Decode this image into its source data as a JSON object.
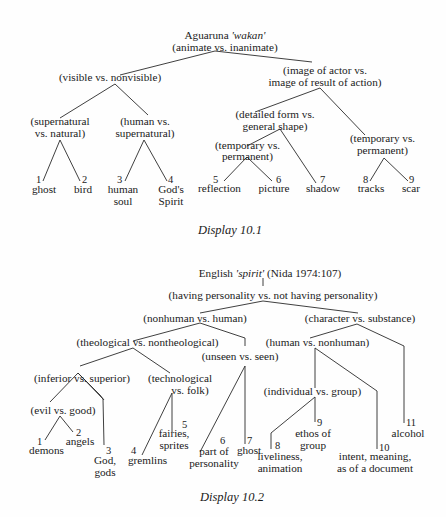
{
  "display1": {
    "caption": "Display 10.1",
    "root": {
      "word_prefix": "Aguaruna ",
      "word": "'wakan'",
      "contrast": "(animate vs. inanimate)"
    },
    "nodes": {
      "visible": "(visible vs. nonvisible)",
      "image_l1": "(image of actor vs.",
      "image_l2": "image of result of action)",
      "super_l1": "(supernatural",
      "super_l2": "vs. natural)",
      "human_l1": "(human vs.",
      "human_l2": "supernatural)",
      "detailed_l1": "(detailed form vs.",
      "detailed_l2": "general shape)",
      "temp1_l1": "(temporary vs.",
      "temp1_l2": "permanent)",
      "temp2_l1": "(temporary vs.",
      "temp2_l2": "permanent)"
    },
    "leaves": [
      {
        "num": "1",
        "label": "ghost"
      },
      {
        "num": "2",
        "label": "bird"
      },
      {
        "num": "3",
        "label": "human",
        "label2": "soul"
      },
      {
        "num": "4",
        "label": "God's",
        "label2": "Spirit"
      },
      {
        "num": "5",
        "label": "reflection"
      },
      {
        "num": "6",
        "label": "picture"
      },
      {
        "num": "7",
        "label": "shadow"
      },
      {
        "num": "8",
        "label": "tracks"
      },
      {
        "num": "9",
        "label": "scar"
      }
    ]
  },
  "display2": {
    "caption": "Display 10.2",
    "root": {
      "word_prefix": "English ",
      "word": "'spirit'",
      "source": " (Nida 1974:107)"
    },
    "nodes": {
      "having": "(having personality vs. not having personality)",
      "nonhuman": "(nonhuman vs. human)",
      "character": "(character vs. substance)",
      "theological": "(theological vs. nontheological)",
      "human_nonhuman": "(human vs. nonhuman)",
      "unseen": "(unseen vs. seen)",
      "inferior": "(inferior vs. superior)",
      "tech_l1": "(technological",
      "tech_l2": "vs. folk)",
      "individual": "(individual vs. group)",
      "evil": "(evil vs. good)"
    },
    "leaves": [
      {
        "num": "1",
        "label": "demons"
      },
      {
        "num": "2",
        "label": "angels"
      },
      {
        "num": "3",
        "label": "God,",
        "label2": "gods"
      },
      {
        "num": "4",
        "label": "gremlins"
      },
      {
        "num": "5",
        "label": "fairies,",
        "label2": "sprites"
      },
      {
        "num": "6",
        "label": "part of",
        "label2": "personality"
      },
      {
        "num": "7",
        "label": "ghost"
      },
      {
        "num": "8",
        "label": "liveliness,",
        "label2": "animation"
      },
      {
        "num": "9",
        "label": "ethos of",
        "label2": "group"
      },
      {
        "num": "10",
        "label": "intent, meaning,",
        "label2": "as of a document"
      },
      {
        "num": "11",
        "label": "alcohol"
      }
    ]
  }
}
